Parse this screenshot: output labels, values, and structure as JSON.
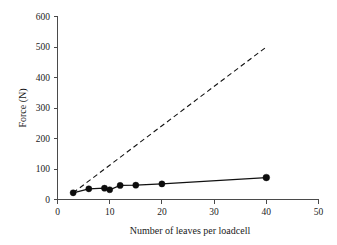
{
  "chart_data": {
    "type": "scatter",
    "title": "",
    "xlabel": "Number of leaves per loadcell",
    "ylabel": "Force (N)",
    "xlim": [
      0,
      50
    ],
    "ylim": [
      0,
      600
    ],
    "xticks": [
      "0",
      "10",
      "20",
      "30",
      "40",
      "50"
    ],
    "yticks": [
      "0",
      "100",
      "200",
      "300",
      "400",
      "500",
      "600"
    ],
    "xtick_values": [
      0,
      10,
      20,
      30,
      40,
      50
    ],
    "ytick_values": [
      0,
      100,
      200,
      300,
      400,
      500,
      600
    ],
    "grid": false,
    "legend": "none",
    "series": [
      {
        "name": "measured",
        "style": "solid-line-with-markers",
        "color": "#111111",
        "markers": true,
        "x": [
          3,
          6,
          9,
          10,
          12,
          15,
          20,
          40
        ],
        "y": [
          22,
          35,
          37,
          32,
          46,
          47,
          51,
          72
        ]
      },
      {
        "name": "theoretical",
        "style": "dashed-line",
        "color": "#111111",
        "markers": false,
        "x": [
          3,
          40
        ],
        "y": [
          22,
          500
        ]
      }
    ]
  },
  "axes": {
    "x_title": "Number of leaves per loadcell",
    "y_title": "Force (N)"
  }
}
